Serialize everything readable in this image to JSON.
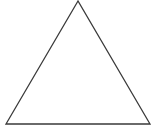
{
  "diagram": {
    "shape": "triangle",
    "kind": "equilateral-outline",
    "vertices": {
      "apex": [
        78,
        1
      ],
      "bottom_left": [
        6,
        124
      ],
      "bottom_right": [
        150,
        124
      ]
    },
    "stroke_color": "#3a3a3a",
    "fill_color": "#ffffff",
    "stroke_width": 1.3
  }
}
